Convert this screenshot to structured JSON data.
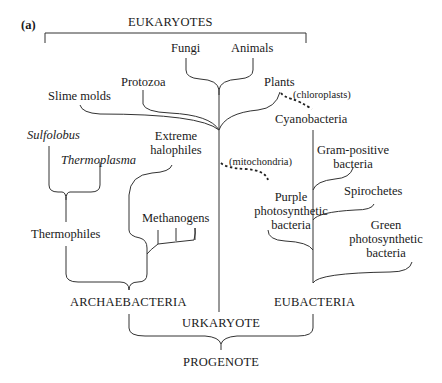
{
  "panel_label": "(a)",
  "diagram": {
    "groups": {
      "eukaryotes": "EUKARYOTES",
      "archaebacteria": "ARCHAEBACTERIA",
      "eubacteria": "EUBACTERIA",
      "urkaryote": "URKARYOTE",
      "progenote": "PROGENOTE"
    },
    "eukaryote_taxa": {
      "fungi": "Fungi",
      "animals": "Animals",
      "protozoa": "Protozoa",
      "slime_molds": "Slime molds",
      "plants": "Plants"
    },
    "archaebacteria_taxa": {
      "sulfolobus": "Sulfolobus",
      "thermoplasma": "Thermoplasma",
      "thermophiles": "Thermophiles",
      "extreme_halophiles": "Extreme\nhalophiles",
      "methanogens": "Methanogens"
    },
    "eubacteria_taxa": {
      "cyanobacteria": "Cyanobacteria",
      "gram_positive": "Gram-positive\nbacteria",
      "spirochetes": "Spirochetes",
      "green_photosynthetic": "Green\nphotosynthetic\nbacteria",
      "purple_photosynthetic": "Purple\nphotosynthetic\nbacteria"
    },
    "endosymbiosis_annotations": {
      "chloroplasts": "(chloroplasts)",
      "mitochondria": "(mitochondria)"
    },
    "line_color": "#333333",
    "text_color": "#1a1a1a"
  }
}
